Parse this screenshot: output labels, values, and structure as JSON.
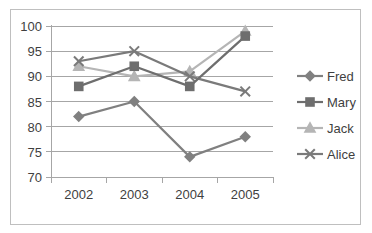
{
  "chart_data": {
    "type": "line",
    "title": "",
    "xlabel": "",
    "ylabel": "",
    "categories": [
      "2002",
      "2003",
      "2004",
      "2005"
    ],
    "x_tick_labels": [
      "2002",
      "2003",
      "2004",
      "2005"
    ],
    "y_tick_labels": [
      "70",
      "75",
      "80",
      "85",
      "90",
      "95",
      "100"
    ],
    "y_ticks": [
      70,
      75,
      80,
      85,
      90,
      95,
      100
    ],
    "ylim": [
      70,
      100
    ],
    "grid": "horizontal",
    "legend_position": "right",
    "series": [
      {
        "name": "Fred",
        "values": [
          82,
          85,
          74,
          78
        ],
        "color": "#808080",
        "marker": "diamond"
      },
      {
        "name": "Mary",
        "values": [
          88,
          92,
          88,
          98
        ],
        "color": "#6e6e6e",
        "marker": "square"
      },
      {
        "name": "Jack",
        "values": [
          92,
          90,
          91,
          99
        ],
        "color": "#b5b5b5",
        "marker": "triangle"
      },
      {
        "name": "Alice",
        "values": [
          93,
          95,
          90,
          87
        ],
        "color": "#7a7a7a",
        "marker": "x"
      }
    ]
  },
  "legend": {
    "items": [
      {
        "label": "Fred"
      },
      {
        "label": "Mary"
      },
      {
        "label": "Jack"
      },
      {
        "label": "Alice"
      }
    ]
  },
  "axes": {
    "y_labels": [
      "100",
      "95",
      "90",
      "85",
      "80",
      "75",
      "70"
    ],
    "x_labels": [
      "2002",
      "2003",
      "2004",
      "2005"
    ]
  },
  "colors": {
    "frame_border": "#bfbfbf",
    "gridline": "#a6a6a6",
    "text": "#3f3f3f",
    "background": "#ffffff"
  }
}
